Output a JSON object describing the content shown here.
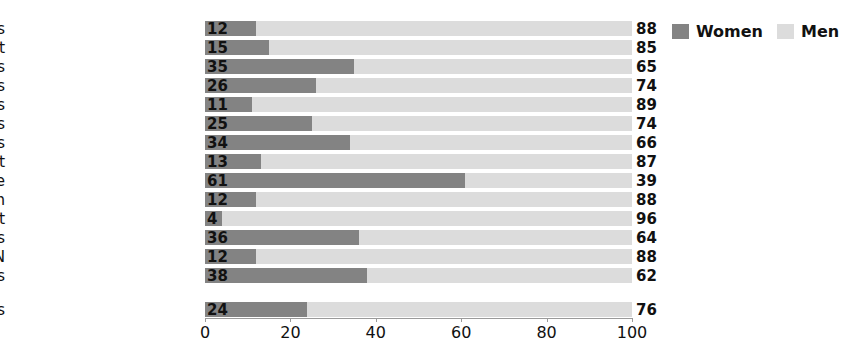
{
  "chart_data": {
    "type": "bar",
    "orientation": "horizontal",
    "stacked": true,
    "stacked_total": 100,
    "title": "",
    "xlabel": "",
    "ylabel": "",
    "xlim": [
      0,
      100
    ],
    "grid": false,
    "legend_position": "top-right",
    "categories": [
      "Economy, business",
      "Politics, government",
      "Crime, legal stories",
      "Sports",
      "Labour issues, strikes",
      "Disaster, accidents",
      "Social issues",
      "Arts, entertainment",
      "Health, medicine",
      "War, terrorism",
      "Environment",
      "Human rights",
      "International crisis, UN",
      "Riots, demonstrations"
    ],
    "series": [
      {
        "name": "Women",
        "color": "#838383",
        "values": [
          12,
          15,
          35,
          26,
          11,
          25,
          34,
          13,
          61,
          12,
          4,
          36,
          12,
          38
        ]
      },
      {
        "name": "Men",
        "color": "#dcdcdc",
        "values": [
          88,
          85,
          65,
          74,
          89,
          74,
          66,
          87,
          39,
          88,
          96,
          64,
          88,
          62
        ]
      }
    ],
    "summary_row": {
      "category": "All subjects",
      "women": 24,
      "men": 76
    },
    "xticks": [
      0,
      20,
      40,
      60,
      80,
      100
    ],
    "xtick_labels": [
      "0",
      "20",
      "40",
      "60",
      "80",
      "100"
    ]
  },
  "legend": {
    "items": [
      {
        "label": "Women",
        "color": "#838383",
        "swatch": "women-swatch"
      },
      {
        "label": "Men",
        "color": "#dcdcdc",
        "swatch": "men-swatch"
      }
    ]
  },
  "colors": {
    "women": "#838383",
    "men": "#dcdcdc",
    "axis": "#9a9a9a",
    "text": "#111111",
    "background": "#ffffff"
  }
}
